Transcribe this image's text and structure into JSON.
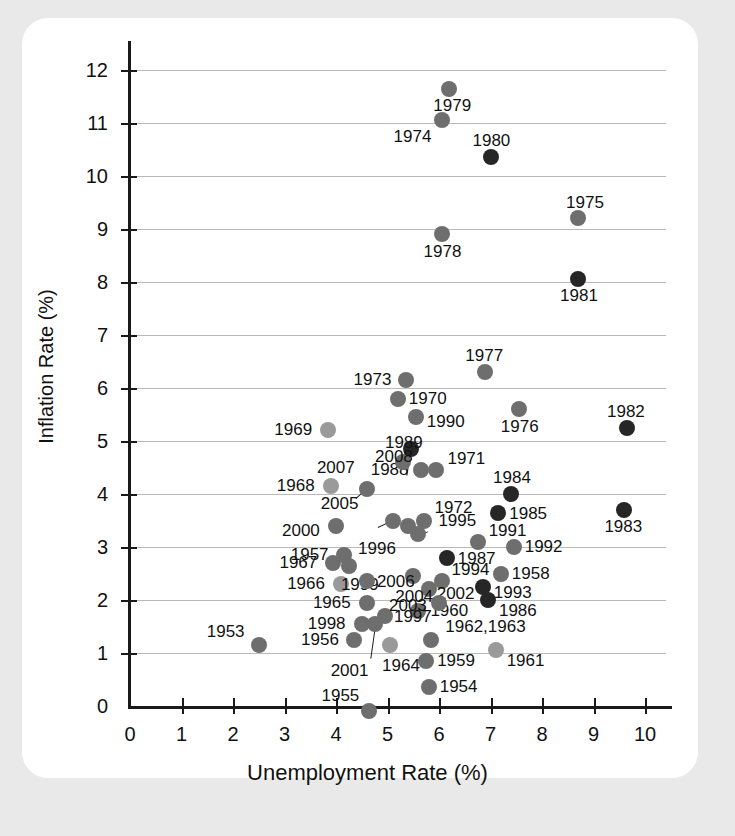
{
  "figure": {
    "background_color": "#e9e9e9",
    "card_color": "#ffffff",
    "grid_color": "#b9b9b9",
    "axis_color": "#1a1a1a"
  },
  "chart_data": {
    "type": "scatter",
    "title": "",
    "xlabel": "Unemployment Rate (%)",
    "ylabel": "Inflation Rate (%)",
    "xlim": [
      0,
      10.4
    ],
    "ylim": [
      0,
      12.4
    ],
    "xticks": [
      0,
      1,
      2,
      3,
      4,
      5,
      6,
      7,
      8,
      9,
      10
    ],
    "xtick_labels": [
      "0",
      "1",
      "2",
      "3",
      "4",
      "5",
      "6",
      "7",
      "8",
      "9",
      "10"
    ],
    "yticks": [
      0,
      1,
      2,
      3,
      4,
      5,
      6,
      7,
      8,
      9,
      10,
      11,
      12
    ],
    "ytick_labels": [
      "0",
      "1",
      "2",
      "3",
      "4",
      "5",
      "6",
      "7",
      "8",
      "9",
      "10",
      "11",
      "12"
    ],
    "grid": "horizontal",
    "legend": "none",
    "marker_shape": "circle",
    "colors": {
      "light": "#9a9a9a",
      "medium": "#6e6e6e",
      "dark": "#262626"
    },
    "points": [
      {
        "label": "1953",
        "x": 2.5,
        "y": 1.15,
        "shade": "medium",
        "lx": -52,
        "ly": -22
      },
      {
        "label": "1954",
        "x": 5.8,
        "y": 0.35,
        "shade": "medium",
        "lx": 11,
        "ly": -9
      },
      {
        "label": "1955",
        "x": 4.65,
        "y": -0.1,
        "shade": "medium",
        "lx": -48,
        "ly": -24
      },
      {
        "label": "1956",
        "x": 4.35,
        "y": 1.25,
        "shade": "medium",
        "lx": -53,
        "ly": -9
      },
      {
        "label": "1957",
        "x": 4.15,
        "y": 2.85,
        "shade": "medium",
        "lx": -53,
        "ly": -9
      },
      {
        "label": "1958",
        "x": 7.2,
        "y": 2.5,
        "shade": "medium",
        "lx": 11,
        "ly": -9
      },
      {
        "label": "1959",
        "x": 5.75,
        "y": 0.85,
        "shade": "medium",
        "lx": 11,
        "ly": -9
      },
      {
        "label": "1960",
        "x": 5.6,
        "y": 1.8,
        "shade": "medium",
        "lx": 12,
        "ly": -9
      },
      {
        "label": "1961",
        "x": 7.1,
        "y": 1.05,
        "shade": "light",
        "lx": 11,
        "ly": 2
      },
      {
        "label": "1962,1963",
        "x": 5.85,
        "y": 1.25,
        "shade": "medium",
        "lx": 14,
        "ly": -22
      },
      {
        "label": "1964",
        "x": 5.05,
        "y": 1.15,
        "shade": "light",
        "lx": -8,
        "ly": 12
      },
      {
        "label": "1965",
        "x": 4.6,
        "y": 1.95,
        "shade": "medium",
        "lx": -54,
        "ly": -9
      },
      {
        "label": "1966",
        "x": 4.1,
        "y": 2.3,
        "shade": "light",
        "lx": -54,
        "ly": -9
      },
      {
        "label": "1967",
        "x": 3.95,
        "y": 2.7,
        "shade": "medium",
        "lx": -54,
        "ly": -9
      },
      {
        "label": "1968",
        "x": 3.9,
        "y": 4.15,
        "shade": "light",
        "lx": -54,
        "ly": -9
      },
      {
        "label": "1969",
        "x": 3.85,
        "y": 5.2,
        "shade": "light",
        "lx": -54,
        "ly": -9
      },
      {
        "label": "1970",
        "x": 5.2,
        "y": 5.8,
        "shade": "medium",
        "lx": 11,
        "ly": -9
      },
      {
        "label": "1971",
        "x": 5.95,
        "y": 4.45,
        "shade": "medium",
        "lx": 11,
        "ly": -20
      },
      {
        "label": "1972",
        "x": 5.7,
        "y": 3.5,
        "shade": "medium",
        "lx": 11,
        "ly": -22
      },
      {
        "label": "1973",
        "x": 5.35,
        "y": 6.15,
        "shade": "medium",
        "lx": -52,
        "ly": -9
      },
      {
        "label": "1974",
        "x": 6.05,
        "y": 11.05,
        "shade": "medium",
        "lx": -48,
        "ly": 8
      },
      {
        "label": "1975",
        "x": 8.7,
        "y": 9.2,
        "shade": "medium",
        "lx": -12,
        "ly": -24
      },
      {
        "label": "1976",
        "x": 7.55,
        "y": 5.6,
        "shade": "medium",
        "lx": -18,
        "ly": 9
      },
      {
        "label": "1977",
        "x": 6.9,
        "y": 6.3,
        "shade": "medium",
        "lx": -20,
        "ly": -25
      },
      {
        "label": "1978",
        "x": 6.05,
        "y": 8.9,
        "shade": "medium",
        "lx": -18,
        "ly": 9
      },
      {
        "label": "1979",
        "x": 6.2,
        "y": 11.65,
        "shade": "medium",
        "lx": -16,
        "ly": 8
      },
      {
        "label": "1980",
        "x": 7.0,
        "y": 10.35,
        "shade": "dark",
        "lx": -18,
        "ly": -25
      },
      {
        "label": "1981",
        "x": 8.7,
        "y": 8.05,
        "shade": "dark",
        "lx": -18,
        "ly": 8
      },
      {
        "label": "1982",
        "x": 9.65,
        "y": 5.25,
        "shade": "dark",
        "lx": -20,
        "ly": -25
      },
      {
        "label": "1983",
        "x": 9.6,
        "y": 3.7,
        "shade": "dark",
        "lx": -20,
        "ly": 8
      },
      {
        "label": "1984",
        "x": 7.4,
        "y": 4.0,
        "shade": "dark",
        "lx": -18,
        "ly": -25
      },
      {
        "label": "1985",
        "x": 7.15,
        "y": 3.65,
        "shade": "dark",
        "lx": 11,
        "ly": 0
      },
      {
        "label": "1986",
        "x": 6.95,
        "y": 2.0,
        "shade": "dark",
        "lx": 11,
        "ly": 2
      },
      {
        "label": "1987",
        "x": 6.15,
        "y": 2.8,
        "shade": "dark",
        "lx": 11,
        "ly": 0
      },
      {
        "label": "1988",
        "x": 5.45,
        "y": 4.85,
        "shade": "dark",
        "lx": -40,
        "ly": 12
      },
      {
        "label": "1989",
        "x": 5.3,
        "y": 4.6,
        "shade": "medium",
        "lx": -18,
        "ly": -28
      },
      {
        "label": "1990",
        "x": 5.55,
        "y": 5.45,
        "shade": "medium",
        "lx": 11,
        "ly": -4
      },
      {
        "label": "1991",
        "x": 6.75,
        "y": 3.1,
        "shade": "medium",
        "lx": 11,
        "ly": -20
      },
      {
        "label": "1992",
        "x": 7.45,
        "y": 3.0,
        "shade": "medium",
        "lx": 11,
        "ly": -9
      },
      {
        "label": "1993",
        "x": 6.85,
        "y": 2.25,
        "shade": "dark",
        "lx": 11,
        "ly": -3
      },
      {
        "label": "1994",
        "x": 6.05,
        "y": 2.35,
        "shade": "medium",
        "lx": 10,
        "ly": -20
      },
      {
        "label": "1995",
        "x": 5.6,
        "y": 3.25,
        "shade": "medium",
        "lx": 20,
        "ly": -22
      },
      {
        "label": "1996",
        "x": 5.4,
        "y": 3.4,
        "shade": "medium",
        "lx": -50,
        "ly": 14
      },
      {
        "label": "1997",
        "x": 4.95,
        "y": 1.7,
        "shade": "medium",
        "lx": 9,
        "ly": 0
      },
      {
        "label": "1998",
        "x": 4.5,
        "y": 1.55,
        "shade": "medium",
        "lx": -54,
        "ly": -9
      },
      {
        "label": "1999",
        "x": 4.25,
        "y": 2.65,
        "shade": "medium",
        "lx": -8,
        "ly": 10
      },
      {
        "label": "2000",
        "x": 4.0,
        "y": 3.4,
        "shade": "medium",
        "lx": -54,
        "ly": -4
      },
      {
        "label": "2001",
        "x": 4.75,
        "y": 1.55,
        "shade": "medium",
        "lx": -44,
        "ly": 38
      },
      {
        "label": "2002",
        "x": 5.8,
        "y": 2.2,
        "shade": "medium",
        "lx": 8,
        "ly": -4
      },
      {
        "label": "2003",
        "x": 6.0,
        "y": 1.95,
        "shade": "medium",
        "lx": -50,
        "ly": -6
      },
      {
        "label": "2004",
        "x": 5.5,
        "y": 2.45,
        "shade": "medium",
        "lx": -18,
        "ly": 12
      },
      {
        "label": "2005",
        "x": 5.1,
        "y": 3.5,
        "shade": "medium",
        "lx": -72,
        "ly": -26
      },
      {
        "label": "2006",
        "x": 4.6,
        "y": 2.35,
        "shade": "medium",
        "lx": 10,
        "ly": 0
      },
      {
        "label": "2007",
        "x": 4.6,
        "y": 4.1,
        "shade": "medium",
        "lx": -50,
        "ly": -30
      },
      {
        "label": "2008",
        "x": 5.65,
        "y": 4.45,
        "shade": "medium",
        "lx": -46,
        "ly": -22
      }
    ],
    "leaders": [
      {
        "from_label": "2007",
        "x1": 4.38,
        "y1": 3.92,
        "x2": 4.58,
        "y2": 4.1
      },
      {
        "from_label": "2005",
        "x1": 4.82,
        "y1": 3.38,
        "x2": 5.08,
        "y2": 3.5
      },
      {
        "from_label": "1988",
        "x1": 5.38,
        "y1": 4.35,
        "x2": 5.45,
        "y2": 4.78
      },
      {
        "from_label": "1995",
        "x1": 5.78,
        "y1": 3.3,
        "x2": 5.6,
        "y2": 3.25
      },
      {
        "from_label": "2001",
        "x1": 4.68,
        "y1": 0.9,
        "x2": 4.77,
        "y2": 1.52
      }
    ]
  }
}
